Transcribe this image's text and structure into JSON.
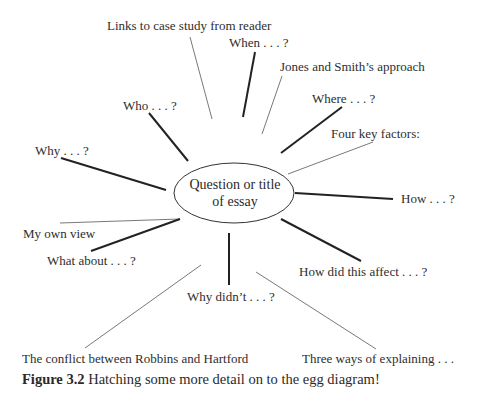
{
  "diagram": {
    "center": "Question or title of essay",
    "center_line1": "Question or title",
    "center_line2": "of essay",
    "branches": [
      {
        "id": "links",
        "label": "Links to case study from reader",
        "weight": "thin"
      },
      {
        "id": "when",
        "label": "When . . . ?",
        "weight": "thick"
      },
      {
        "id": "jones",
        "label": "Jones and Smith’s approach",
        "weight": "thin"
      },
      {
        "id": "where",
        "label": "Where . . . ?",
        "weight": "thick"
      },
      {
        "id": "four",
        "label": "Four key factors:",
        "weight": "thin"
      },
      {
        "id": "how",
        "label": "How . . . ?",
        "weight": "thick"
      },
      {
        "id": "howdid",
        "label": "How did this affect . . . ?",
        "weight": "thick"
      },
      {
        "id": "three",
        "label": "Three ways of explaining . . .",
        "weight": "thin"
      },
      {
        "id": "whydidnt",
        "label": "Why didn’t . . . ?",
        "weight": "thick"
      },
      {
        "id": "conflict",
        "label": "The conflict between Robbins and Hartford",
        "weight": "thin"
      },
      {
        "id": "whatabout",
        "label": "What about . . . ?",
        "weight": "thick"
      },
      {
        "id": "myown",
        "label": "My own view",
        "weight": "thin"
      },
      {
        "id": "why",
        "label": "Why . . . ?",
        "weight": "thick"
      },
      {
        "id": "who",
        "label": "Who . . . ?",
        "weight": "thick"
      }
    ]
  },
  "caption": {
    "figure_number": "Figure 3.2",
    "text": "Hatching some more detail on to the egg diagram!"
  }
}
